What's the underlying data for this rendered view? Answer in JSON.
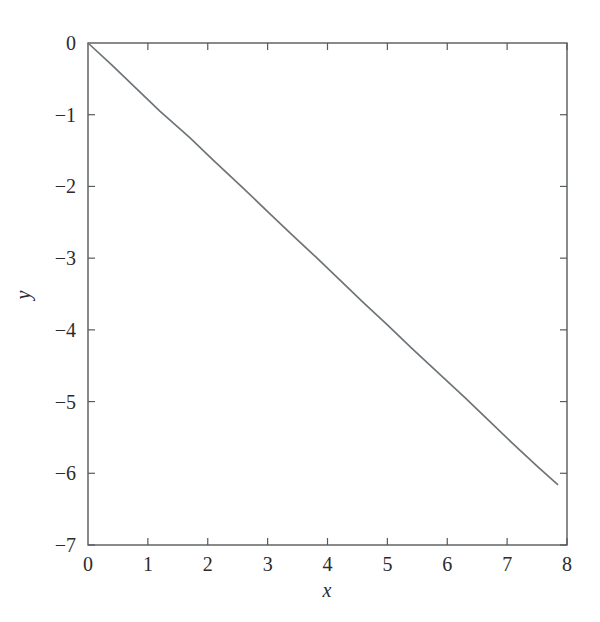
{
  "figure": {
    "background_color": "#ffffff",
    "axis_color": "#555a5c",
    "line_color": "#6e7477",
    "text_color": "#2b2b2b"
  },
  "axes": {
    "xlabel": "x",
    "ylabel": "y",
    "x_ticks": [
      "0",
      "1",
      "2",
      "3",
      "4",
      "5",
      "6",
      "7",
      "8"
    ],
    "y_ticks": [
      "0",
      "−1",
      "−2",
      "−3",
      "−4",
      "−5",
      "−6",
      "−7"
    ]
  },
  "chart_data": {
    "type": "line",
    "title": "",
    "subtitle": "",
    "xlabel": "x",
    "ylabel": "y",
    "xlim": [
      0,
      8
    ],
    "ylim": [
      -7,
      0
    ],
    "xticks": [
      0,
      1,
      2,
      3,
      4,
      5,
      6,
      7,
      8
    ],
    "yticks": [
      0,
      -1,
      -2,
      -3,
      -4,
      -5,
      -6,
      -7
    ],
    "grid": false,
    "legend": null,
    "legend_position": "none",
    "annotations": [],
    "series": [
      {
        "name": "y",
        "color": "#6e7477",
        "x": [
          0.0,
          0.4,
          0.8,
          1.2,
          1.7,
          2.1,
          2.6,
          3.0,
          3.4,
          3.8,
          4.2,
          4.6,
          5.0,
          5.4,
          5.8,
          6.3,
          6.7,
          7.1,
          7.5,
          7.85
        ],
        "y": [
          0.0,
          -0.31,
          -0.63,
          -0.95,
          -1.32,
          -1.64,
          -2.03,
          -2.35,
          -2.67,
          -2.98,
          -3.3,
          -3.62,
          -3.93,
          -4.25,
          -4.56,
          -4.95,
          -5.27,
          -5.59,
          -5.9,
          -6.16
        ]
      }
    ]
  }
}
